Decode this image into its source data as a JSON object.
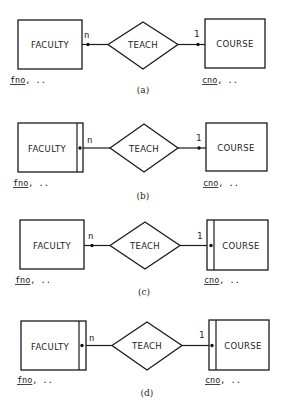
{
  "figure": {
    "panels": [
      {
        "id": "a",
        "caption": "(a)",
        "left_entity": {
          "name": "FACULTY",
          "weak": false,
          "attr_key": "fno",
          "attr_rest": ", .."
        },
        "relationship": {
          "name": "TEACH"
        },
        "right_entity": {
          "name": "COURSE",
          "weak": false,
          "attr_key": "cno",
          "attr_rest": ", .."
        },
        "left_cardinality": "n",
        "right_cardinality": "1"
      },
      {
        "id": "b",
        "caption": "(b)",
        "left_entity": {
          "name": "FACULTY",
          "weak": true,
          "attr_key": "fno",
          "attr_rest": ", .."
        },
        "relationship": {
          "name": "TEACH"
        },
        "right_entity": {
          "name": "COURSE",
          "weak": false,
          "attr_key": "cno",
          "attr_rest": ", .."
        },
        "left_cardinality": "n",
        "right_cardinality": "1"
      },
      {
        "id": "c",
        "caption": "(c)",
        "left_entity": {
          "name": "FACULTY",
          "weak": false,
          "attr_key": "fno",
          "attr_rest": ", .."
        },
        "relationship": {
          "name": "TEACH"
        },
        "right_entity": {
          "name": "COURSE",
          "weak": true,
          "attr_key": "cno",
          "attr_rest": ", .."
        },
        "left_cardinality": "n",
        "right_cardinality": "1"
      },
      {
        "id": "d",
        "caption": "(d)",
        "left_entity": {
          "name": "FACULTY",
          "weak": true,
          "attr_key": "fno",
          "attr_rest": ", .."
        },
        "relationship": {
          "name": "TEACH"
        },
        "right_entity": {
          "name": "COURSE",
          "weak": true,
          "attr_key": "cno",
          "attr_rest": ", .."
        },
        "left_cardinality": "n",
        "right_cardinality": "1"
      }
    ]
  },
  "colors": {
    "ink": "#1a1a1a",
    "background": "#ffffff"
  }
}
